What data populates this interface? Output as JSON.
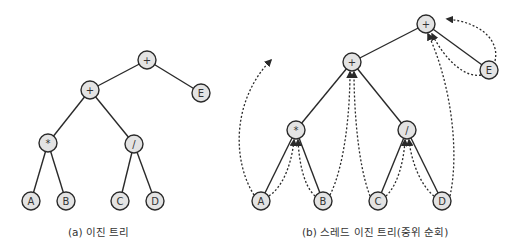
{
  "figure": {
    "left": {
      "caption": "(a) 이진 트리",
      "nodes": [
        {
          "id": "root",
          "label": "+",
          "x": 147,
          "y": 60
        },
        {
          "id": "plus2",
          "label": "+",
          "x": 90,
          "y": 90
        },
        {
          "id": "E",
          "label": "E",
          "x": 201,
          "y": 93
        },
        {
          "id": "mul",
          "label": "*",
          "x": 48,
          "y": 143
        },
        {
          "id": "div",
          "label": "/",
          "x": 134,
          "y": 144
        },
        {
          "id": "A",
          "label": "A",
          "x": 31,
          "y": 201
        },
        {
          "id": "B",
          "label": "B",
          "x": 66,
          "y": 201
        },
        {
          "id": "C",
          "label": "C",
          "x": 120,
          "y": 201
        },
        {
          "id": "D",
          "label": "D",
          "x": 155,
          "y": 201
        }
      ],
      "edges": [
        [
          "root",
          "plus2"
        ],
        [
          "root",
          "E"
        ],
        [
          "plus2",
          "mul"
        ],
        [
          "plus2",
          "div"
        ],
        [
          "mul",
          "A"
        ],
        [
          "mul",
          "B"
        ],
        [
          "div",
          "C"
        ],
        [
          "div",
          "D"
        ]
      ]
    },
    "right": {
      "caption": "(b) 스레드 이진 트리(중위 순회)",
      "nodes": [
        {
          "id": "root",
          "label": "+",
          "x": 426,
          "y": 24
        },
        {
          "id": "plus2",
          "label": "+",
          "x": 352,
          "y": 62
        },
        {
          "id": "E",
          "label": "E",
          "x": 489,
          "y": 70
        },
        {
          "id": "mul",
          "label": "*",
          "x": 296,
          "y": 130
        },
        {
          "id": "div",
          "label": "/",
          "x": 407,
          "y": 130
        },
        {
          "id": "A",
          "label": "A",
          "x": 261,
          "y": 201
        },
        {
          "id": "B",
          "label": "B",
          "x": 323,
          "y": 201
        },
        {
          "id": "C",
          "label": "C",
          "x": 378,
          "y": 201
        },
        {
          "id": "D",
          "label": "D",
          "x": 442,
          "y": 201
        }
      ],
      "edges": [
        [
          "root",
          "plus2"
        ],
        [
          "root",
          "E"
        ],
        [
          "plus2",
          "mul"
        ],
        [
          "plus2",
          "div"
        ],
        [
          "mul",
          "A"
        ],
        [
          "mul",
          "B"
        ],
        [
          "div",
          "C"
        ],
        [
          "div",
          "D"
        ]
      ],
      "threads": [
        {
          "from": "A",
          "to": "null-left",
          "d": "M254,195 C232,160 232,100 271,60"
        },
        {
          "from": "A",
          "to": "mul",
          "d": "M269,196 C285,185 292,160 294,140"
        },
        {
          "from": "B",
          "to": "mul",
          "d": "M315,196 C303,185 299,160 298,140"
        },
        {
          "from": "B",
          "to": "plus2",
          "d": "M330,195 C345,165 350,110 350,72"
        },
        {
          "from": "C",
          "to": "plus2",
          "d": "M370,196 C358,165 354,110 354,72"
        },
        {
          "from": "C",
          "to": "div",
          "d": "M386,196 C398,185 404,160 405,140"
        },
        {
          "from": "D",
          "to": "div",
          "d": "M434,196 C420,185 411,160 409,140"
        },
        {
          "from": "D",
          "to": "root",
          "d": "M450,196 C460,150 450,80 428,34"
        },
        {
          "from": "E",
          "to": "root",
          "d": "M481,75 C465,78 445,60 432,34"
        },
        {
          "from": "E",
          "to": "null-right",
          "d": "M495,61 C500,40 480,22 447,19"
        }
      ]
    }
  }
}
